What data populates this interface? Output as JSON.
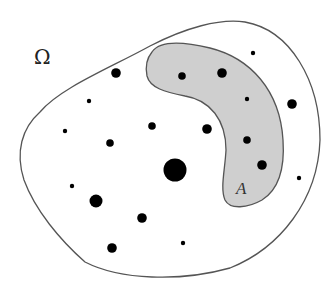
{
  "diagram": {
    "labels": {
      "domain": "Ω",
      "subset": "A"
    },
    "colors": {
      "background": "#ffffff",
      "domain_stroke": "#555555",
      "subset_fill": "#cfcfcf",
      "subset_stroke": "#555555",
      "dot": "#000000"
    },
    "dots_outside_A": [
      {
        "id": "o1",
        "size": "medium"
      },
      {
        "id": "o2",
        "size": "tiny"
      },
      {
        "id": "o3",
        "size": "tiny"
      },
      {
        "id": "o4",
        "size": "small"
      },
      {
        "id": "o5",
        "size": "small"
      },
      {
        "id": "o6",
        "size": "medium"
      },
      {
        "id": "o7",
        "size": "huge"
      },
      {
        "id": "o8",
        "size": "tiny"
      },
      {
        "id": "o9",
        "size": "large"
      },
      {
        "id": "o10",
        "size": "medium"
      },
      {
        "id": "o11",
        "size": "medium"
      },
      {
        "id": "o12",
        "size": "tiny"
      },
      {
        "id": "o13",
        "size": "tiny"
      },
      {
        "id": "o14",
        "size": "medium"
      },
      {
        "id": "o15",
        "size": "tiny"
      }
    ],
    "dots_inside_A": [
      {
        "id": "a1",
        "size": "small"
      },
      {
        "id": "a2",
        "size": "medium"
      },
      {
        "id": "a3",
        "size": "tiny"
      },
      {
        "id": "a4",
        "size": "small"
      },
      {
        "id": "a5",
        "size": "medium"
      }
    ]
  }
}
